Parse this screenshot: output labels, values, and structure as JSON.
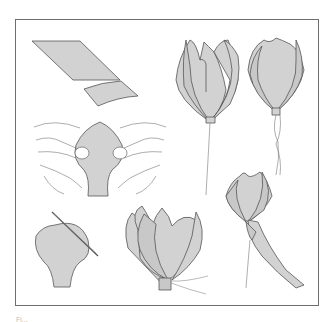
{
  "figure": {
    "colors": {
      "fill": "#d2d2d2",
      "stroke": "#555555",
      "frame": "#6e6e6e"
    },
    "steps": [
      {
        "id": "cut-strip",
        "label": "Fabric strip cut diagonally into petal pieces"
      },
      {
        "id": "stretch-petal",
        "label": "Hands stretching and cupping petal"
      },
      {
        "id": "gather-petal",
        "label": "Petal with gathering needle and thread"
      },
      {
        "id": "assemble-petals",
        "label": "Petals gathered around center and bound"
      },
      {
        "id": "open-flower-wire",
        "label": "Assembled open flower on wire stem"
      },
      {
        "id": "closed-flower-wire",
        "label": "Closed bud on wire stem"
      },
      {
        "id": "wrap-stem",
        "label": "Flower base wrapped with fabric strip"
      }
    ]
  },
  "caption": "Fi..."
}
